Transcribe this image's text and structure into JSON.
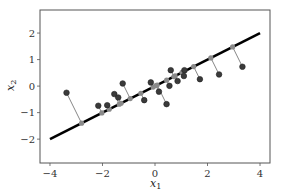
{
  "chart_data": {
    "type": "scatter",
    "title": "",
    "xlabel": "x_1",
    "ylabel": "x_2",
    "xlim": [
      -4.38,
      4.38
    ],
    "ylim": [
      -2.9,
      2.87
    ],
    "xticks": [
      -4,
      -2,
      0,
      2,
      4
    ],
    "yticks": [
      -2,
      -1,
      0,
      1,
      2
    ],
    "xtick_labels": [
      "−4",
      "−2",
      "0",
      "2",
      "4"
    ],
    "ytick_labels": [
      "−2",
      "−1",
      "0",
      "1",
      "2"
    ],
    "grid": false,
    "legend": null,
    "line": {
      "name": "principal direction",
      "x": [
        -4,
        4
      ],
      "y": [
        -2,
        2
      ],
      "color": "#000000"
    },
    "points": {
      "name": "data",
      "color": "#3a3a3a",
      "x": [
        -3.37,
        -2.16,
        -1.82,
        -1.55,
        -1.4,
        -1.23,
        -0.41,
        -0.16,
        0.15,
        0.44,
        0.55,
        0.6,
        0.86,
        1.1,
        1.12,
        1.71,
        2.44,
        3.33
      ],
      "y": [
        -0.25,
        -0.74,
        -0.72,
        -0.3,
        -0.43,
        0.1,
        -0.53,
        0.14,
        -0.21,
        -0.68,
        0.01,
        0.6,
        0.19,
        0.38,
        0.6,
        0.26,
        0.44,
        0.73
      ]
    },
    "projections": {
      "name": "orthogonal projections onto line",
      "color": "#888888"
    }
  },
  "labels": {
    "xlabel_main": "x",
    "xlabel_sub": "1",
    "ylabel_main": "x",
    "ylabel_sub": "2"
  }
}
